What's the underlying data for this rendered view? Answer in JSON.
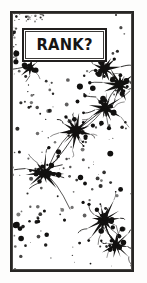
{
  "panel": {
    "title": "RANK?",
    "width": 147,
    "height": 283,
    "background_color": "#fdfdfc",
    "ink_color": "#1a1918",
    "paper_color": "#ffffff"
  },
  "frame": {
    "name": "comic-panel-border",
    "style": "double-line-rectangle",
    "color": "#272624"
  },
  "caption": {
    "text": "RANK?",
    "box_color": "#ffffff",
    "border_color": "#211f1e",
    "text_color": "#161514"
  },
  "artwork": {
    "description": "Black ink splatter illustration of spiky star-like neuron blots connected by thin filaments, scattered across a speckled field",
    "motif": "ink-splatter-neurons",
    "ink_color": "#121110",
    "clusters": [
      {
        "name": "cluster-upper-left-small",
        "cx": 18,
        "cy": 55,
        "radius": 7,
        "spikes": 8
      },
      {
        "name": "cluster-upper-right",
        "cx": 92,
        "cy": 56,
        "radius": 10,
        "spikes": 12
      },
      {
        "name": "cluster-right-upper",
        "cx": 108,
        "cy": 72,
        "radius": 11,
        "spikes": 12
      },
      {
        "name": "cluster-center-right",
        "cx": 93,
        "cy": 95,
        "radius": 12,
        "spikes": 13
      },
      {
        "name": "cluster-center",
        "cx": 64,
        "cy": 118,
        "radius": 13,
        "spikes": 14
      },
      {
        "name": "cluster-mid-left",
        "cx": 32,
        "cy": 160,
        "radius": 12,
        "spikes": 13
      },
      {
        "name": "cluster-lower-right",
        "cx": 92,
        "cy": 207,
        "radius": 13,
        "spikes": 14
      },
      {
        "name": "cluster-bottom-right",
        "cx": 104,
        "cy": 232,
        "radius": 10,
        "spikes": 11
      }
    ],
    "speckle_density": "heavy-upper-left",
    "dot_count": 180
  }
}
